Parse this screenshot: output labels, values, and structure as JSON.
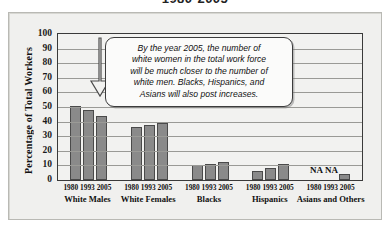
{
  "title": "1980-2005",
  "axis": {
    "y_title": "Percentage of Total Workers",
    "y_ticks": [
      "100",
      "90",
      "80",
      "70",
      "60",
      "50",
      "40",
      "30",
      "20",
      "10",
      "0"
    ]
  },
  "callout": {
    "lines": [
      "By the year 2005, the number of",
      "white women in the total work force",
      "will be much closer to the number of",
      "white men. Blacks, Hispanics, and",
      "Asians will also post increases."
    ]
  },
  "na_markers": {
    "first": "NA",
    "second": "NA"
  },
  "groups": [
    {
      "name": "White Males",
      "years": "1980 1993 2005"
    },
    {
      "name": "White Females",
      "years": "1980 1993 2005"
    },
    {
      "name": "Blacks",
      "years": "1980 1993 2005"
    },
    {
      "name": "Hispanics",
      "years": "1980 1993 2005"
    },
    {
      "name": "Asians and Others",
      "years": "1980 1993 2005"
    }
  ],
  "colors": {
    "bar": "#8a8a8a",
    "bar_edge": "#4a4a4a",
    "panel": "#f0f0ee",
    "plot": "#f2f2f0"
  },
  "chart_data": {
    "type": "bar",
    "title": "1980-2005",
    "xlabel": "",
    "ylabel": "Percentage of Total Workers",
    "ylim": [
      0,
      100
    ],
    "ytick_step": 10,
    "grid": true,
    "legend": "none",
    "categories": [
      "White Males",
      "White Females",
      "Blacks",
      "Hispanics",
      "Asians and Others"
    ],
    "series": [
      {
        "name": "1980",
        "values": [
          51,
          36,
          10,
          6,
          null
        ]
      },
      {
        "name": "1993",
        "values": [
          48,
          38,
          11,
          8,
          null
        ]
      },
      {
        "name": "2005",
        "values": [
          44,
          39,
          12,
          11,
          4
        ]
      }
    ],
    "annotations": [
      {
        "text": "NA",
        "category": "Asians and Others",
        "series": "1980"
      },
      {
        "text": "NA",
        "category": "Asians and Others",
        "series": "1993"
      },
      {
        "text": "By the year 2005, the number of white women in the total work force will be much closer to the number of white men. Blacks, Hispanics, and Asians will also post increases.",
        "points_to": [
          "White Males 2005",
          "White Females 2005"
        ]
      }
    ]
  }
}
